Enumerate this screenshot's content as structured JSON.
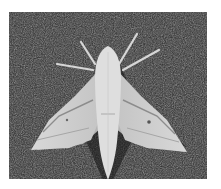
{
  "image": {
    "subject": "hawk moth on gravel",
    "alt": "Black and white photograph of a pale hawk moth with wings spread resting on dark gravel",
    "colors": {
      "background": "#2a2a2a",
      "moth_light": "#e4e4e4",
      "moth_mid": "#c8c8c8",
      "moth_shadow": "#9a9a9a"
    }
  }
}
